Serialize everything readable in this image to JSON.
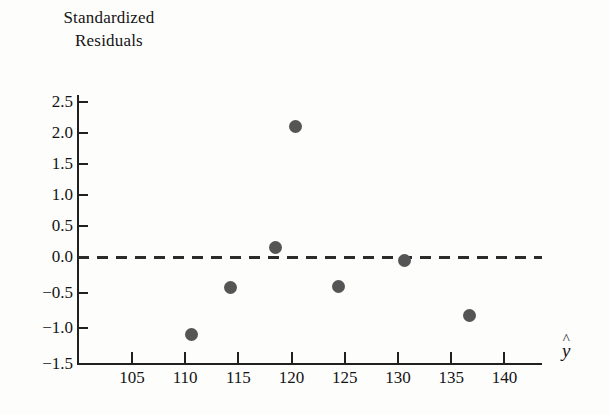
{
  "chart_data": {
    "type": "scatter",
    "title": "Standardized\nResiduals",
    "ylabel": "Standardized Residuals",
    "xlabel": "ŷ",
    "xlabel_plain": "y-hat",
    "xlim": [
      101.5,
      143.5
    ],
    "ylim": [
      -1.5,
      2.75
    ],
    "grid": false,
    "legend": null,
    "xticks": [
      105,
      110,
      115,
      120,
      125,
      130,
      135,
      140
    ],
    "xtick_labels": [
      "105",
      "110",
      "115",
      "120",
      "125",
      "130",
      "135",
      "140"
    ],
    "yticks": [
      2.5,
      2.0,
      1.5,
      1.0,
      0.5,
      0.0,
      -0.5,
      -1.0,
      -1.5
    ],
    "ytick_labels": [
      "2.5",
      "2.0",
      "1.5",
      "1.0",
      "0.5",
      "0.0",
      "−0.5",
      "−1.0",
      "−1.5"
    ],
    "reference_line": {
      "y": 0.0,
      "style": "dashed",
      "color": "#2b2b2b"
    },
    "marker": {
      "shape": "circle",
      "color": "#555555",
      "size": 13
    },
    "points": [
      {
        "x": 110.6,
        "y": -1.09
      },
      {
        "x": 114.3,
        "y": -0.43
      },
      {
        "x": 118.5,
        "y": 0.15
      },
      {
        "x": 120.4,
        "y": 2.1
      },
      {
        "x": 124.4,
        "y": -0.41
      },
      {
        "x": 130.6,
        "y": -0.05
      },
      {
        "x": 136.7,
        "y": -0.82
      }
    ]
  },
  "colors": {
    "axis": "#202020",
    "text": "#141414",
    "marker": "#555555",
    "reference": "#2b2b2b",
    "background": "#fdfdfc"
  }
}
